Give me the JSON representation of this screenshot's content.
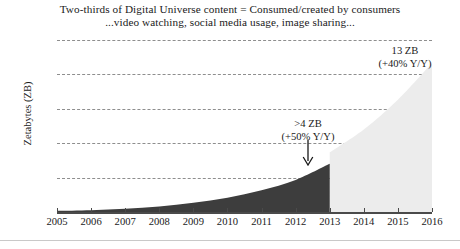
{
  "title": {
    "line1": "Two-thirds of Digital Universe content = Consumed/created by consumers",
    "line2": "...video watching, social media usage, image sharing..."
  },
  "annotations": {
    "midpoint": {
      "value": ">4 ZB",
      "growth": "(+50% Y/Y)",
      "arrow_icon": "down-arrow-icon"
    },
    "endpoint": {
      "value": "13 ZB",
      "growth": "(+40% Y/Y)"
    }
  },
  "colors": {
    "actual_fill": "#3d3d3d",
    "forecast_fill": "#ececec",
    "gridline": "#8e8e8e",
    "axis": "#4a4a4a",
    "text": "#1a1a1a"
  },
  "chart_data": {
    "type": "area",
    "title": "Two-thirds of Digital Universe content = Consumed/created by consumers",
    "subtitle": "...video watching, social media usage, image sharing...",
    "xlabel": "",
    "ylabel": "Zetabytes (ZB)",
    "ylim": [
      0,
      15
    ],
    "yticks": [
      3,
      6,
      9,
      12,
      15
    ],
    "xlim": [
      2005,
      2016
    ],
    "x": [
      2005,
      2006,
      2007,
      2008,
      2009,
      2010,
      2011,
      2012,
      2013,
      2014,
      2015,
      2016
    ],
    "xticks": [
      "2005",
      "2006",
      "2007",
      "2008",
      "2009",
      "2010",
      "2011",
      "2012",
      "2013",
      "2014",
      "2015",
      "2016"
    ],
    "grid": true,
    "legend": "none",
    "series": [
      {
        "name": "Actual",
        "fill": "#3d3d3d",
        "x": [
          2005,
          2006,
          2007,
          2008,
          2009,
          2010,
          2011,
          2012,
          2013
        ],
        "values": [
          0.1,
          0.16,
          0.28,
          0.48,
          0.8,
          1.25,
          1.9,
          2.8,
          4.2
        ]
      },
      {
        "name": "Forecast",
        "fill": "#ececec",
        "x": [
          2013,
          2014,
          2015,
          2016
        ],
        "values": [
          5.2,
          7.2,
          9.8,
          13.0
        ]
      }
    ],
    "annotations": [
      {
        "x": 2013,
        "text": ">4 ZB (+50% Y/Y)"
      },
      {
        "x": 2016,
        "text": "13 ZB (+40% Y/Y)"
      }
    ]
  }
}
